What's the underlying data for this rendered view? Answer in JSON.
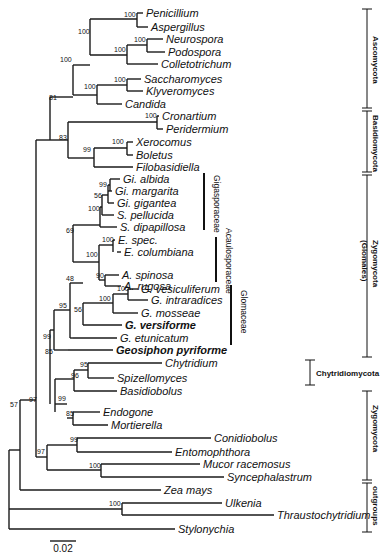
{
  "figure": {
    "type": "phylogenetic_tree",
    "scale_bar": {
      "label": "0.02",
      "x1": 50,
      "x2": 76,
      "y": 541
    }
  },
  "taxa": [
    {
      "name": "Penicillium",
      "x": 146,
      "y": 13,
      "tip_from": 137
    },
    {
      "name": "Aspergillus",
      "x": 151,
      "y": 27,
      "tip_from": 137
    },
    {
      "name": "Neurospora",
      "x": 166,
      "y": 39,
      "tip_from": 147
    },
    {
      "name": "Podospora",
      "x": 168,
      "y": 52,
      "tip_from": 147
    },
    {
      "name": "Colletotrichum",
      "x": 161,
      "y": 64,
      "tip_from": 127
    },
    {
      "name": "Saccharomyces",
      "x": 144,
      "y": 79,
      "tip_from": 127
    },
    {
      "name": "Klyveromyces",
      "x": 146,
      "y": 91,
      "tip_from": 127
    },
    {
      "name": "Candida",
      "x": 125,
      "y": 104,
      "tip_from": 97
    },
    {
      "name": "Cronartium",
      "x": 162,
      "y": 116,
      "tip_from": 157
    },
    {
      "name": "Peridermium",
      "x": 166,
      "y": 129,
      "tip_from": 157
    },
    {
      "name": "Xerocomus",
      "x": 136,
      "y": 142,
      "tip_from": 127
    },
    {
      "name": "Boletus",
      "x": 136,
      "y": 155,
      "tip_from": 127
    },
    {
      "name": "Filobasidiella",
      "x": 136,
      "y": 167,
      "tip_from": 94
    },
    {
      "name": "Gi. albida",
      "x": 123,
      "y": 179,
      "tip_from": 110
    },
    {
      "name": "Gi. margarita",
      "x": 115,
      "y": 191,
      "tip_from": 108
    },
    {
      "name": "Gi. gigantea",
      "x": 117,
      "y": 203,
      "tip_from": 108
    },
    {
      "name": "S. pellucida",
      "x": 117,
      "y": 215,
      "tip_from": 102
    },
    {
      "name": "S. dipapillosa",
      "x": 120,
      "y": 227,
      "tip_from": 100
    },
    {
      "name": "E. spec.",
      "x": 118,
      "y": 240,
      "tip_from": 113
    },
    {
      "name": "E. columbiana",
      "x": 124,
      "y": 252,
      "tip_from": 117
    },
    {
      "name": "A. spinosa",
      "x": 122,
      "y": 275,
      "tip_from": 105
    },
    {
      "name": "A. rugosa",
      "x": 124,
      "y": 286,
      "tip_from": 105
    },
    {
      "name": "G. vesiculiferum",
      "x": 141,
      "y": 289,
      "tip_from": 128
    },
    {
      "name": "G. intraradices",
      "x": 151,
      "y": 300,
      "tip_from": 128
    },
    {
      "name": "G. mosseae",
      "x": 141,
      "y": 313,
      "tip_from": 113
    },
    {
      "name": "G. versiforme",
      "x": 125,
      "y": 325,
      "tip_from": 83,
      "bold": true
    },
    {
      "name": "G. etunicatum",
      "x": 120,
      "y": 338,
      "tip_from": 73
    },
    {
      "name": "Geosiphon pyriforme",
      "x": 116,
      "y": 350,
      "tip_from": 68,
      "bold": true
    },
    {
      "name": "Chytridium",
      "x": 165,
      "y": 363,
      "tip_from": 88
    },
    {
      "name": "Spizellomyces",
      "x": 117,
      "y": 378,
      "tip_from": 88
    },
    {
      "name": "Basidiobolus",
      "x": 120,
      "y": 391,
      "tip_from": 74
    },
    {
      "name": "Endogone",
      "x": 103,
      "y": 412,
      "tip_from": 73
    },
    {
      "name": "Mortierella",
      "x": 111,
      "y": 425,
      "tip_from": 73
    },
    {
      "name": "Conidiobolus",
      "x": 214,
      "y": 438,
      "tip_from": 77
    },
    {
      "name": "Entomophthora",
      "x": 175,
      "y": 452,
      "tip_from": 77
    },
    {
      "name": "Mucor racemosus",
      "x": 203,
      "y": 464,
      "tip_from": 101
    },
    {
      "name": "Syncephalastrum",
      "x": 227,
      "y": 477,
      "tip_from": 101
    },
    {
      "name": "Zea mays",
      "x": 164,
      "y": 490,
      "tip_from": 20
    },
    {
      "name": "Ulkenia",
      "x": 225,
      "y": 503,
      "tip_from": 122
    },
    {
      "name": "Thraustochytridium",
      "x": 277,
      "y": 515,
      "tip_from": 122
    },
    {
      "name": "Stylonychia",
      "x": 178,
      "y": 529,
      "tip_from": 9
    }
  ],
  "branches": [
    "M137,13 V27",
    "M90,19 H137",
    "M147,39 V52",
    "M127,45 H147",
    "M127,45 V64",
    "M90,19 V55",
    "M90,55 H127",
    "M127,79 V91",
    "M97,85 H127",
    "M97,85 V104",
    "M73,65 V95",
    "M73,65 H90",
    "M73,95 H97",
    "M157,116 V129",
    "M68,122 H157",
    "M127,142 V155",
    "M94,148 H127",
    "M94,148 V167",
    "M68,122 V158",
    "M68,158 H94",
    "M50,97 V140",
    "M50,97 H73",
    "M50,140 H68",
    "M110,179 V191",
    "M108,185 H110",
    "M108,185 V203",
    "M102,195 V215",
    "M102,195 H108",
    "M100,207 V227",
    "M100,207 H102",
    "M113,240 V252",
    "M99,245 H113",
    "M105,275 V286",
    "M99,280 H105",
    "M99,245 V280",
    "M73,225 V262",
    "M73,225 H100",
    "M73,262 H99",
    "M128,289 V300",
    "M113,294 H128",
    "M113,294 V313",
    "M83,303 V325",
    "M83,303 H113",
    "M70,283 V338",
    "M70,283 H83",
    "M70,338 H73",
    "M54,310 V350",
    "M54,310 H70",
    "M54,350 H68",
    "M88,363 V378",
    "M74,370 H88",
    "M74,370 V391",
    "M55,379 V412",
    "M55,379 H74",
    "M73,412 V425",
    "M67,418 H73",
    "M55,404 H67",
    "M50,330 V404",
    "M50,330 H54",
    "M36,140 V330",
    "M36,140 H50",
    "M77,438 V452",
    "M47,445 H77",
    "M101,464 V477",
    "M47,470 H101",
    "M47,445 V470",
    "M36,457 H47",
    "M36,330 V457",
    "M20,400 V490",
    "M20,400 H36",
    "M122,503 V515",
    "M9,509 H122",
    "M9,509 V529",
    "M9,450 V509",
    "M9,450 H20"
  ],
  "bootstrap": [
    {
      "v": "100",
      "x": 124,
      "y": 17
    },
    {
      "v": "100",
      "x": 78,
      "y": 34
    },
    {
      "v": "100",
      "x": 134,
      "y": 42
    },
    {
      "v": "100",
      "x": 114,
      "y": 52
    },
    {
      "v": "100",
      "x": 60,
      "y": 62
    },
    {
      "v": "100",
      "x": 114,
      "y": 82
    },
    {
      "v": "100",
      "x": 84,
      "y": 89
    },
    {
      "v": "81",
      "x": 49,
      "y": 100
    },
    {
      "v": "100",
      "x": 145,
      "y": 118
    },
    {
      "v": "83",
      "x": 59,
      "y": 140
    },
    {
      "v": "100",
      "x": 112,
      "y": 144
    },
    {
      "v": "99",
      "x": 83,
      "y": 152
    },
    {
      "v": "99",
      "x": 99,
      "y": 187
    },
    {
      "v": "56",
      "x": 94,
      "y": 198
    },
    {
      "v": "100",
      "x": 88,
      "y": 211
    },
    {
      "v": "69",
      "x": 66,
      "y": 233
    },
    {
      "v": "100",
      "x": 102,
      "y": 242
    },
    {
      "v": "100",
      "x": 86,
      "y": 257
    },
    {
      "v": "90",
      "x": 96,
      "y": 278
    },
    {
      "v": "48",
      "x": 66,
      "y": 281
    },
    {
      "v": "100",
      "x": 117,
      "y": 291
    },
    {
      "v": "100",
      "x": 99,
      "y": 301
    },
    {
      "v": "95",
      "x": 59,
      "y": 308
    },
    {
      "v": "56",
      "x": 74,
      "y": 312
    },
    {
      "v": "99",
      "x": 43,
      "y": 339
    },
    {
      "v": "85",
      "x": 45,
      "y": 354
    },
    {
      "v": "95",
      "x": 80,
      "y": 367
    },
    {
      "v": "96",
      "x": 71,
      "y": 378
    },
    {
      "v": "99",
      "x": 58,
      "y": 401
    },
    {
      "v": "85",
      "x": 66,
      "y": 416
    },
    {
      "v": "97",
      "x": 29,
      "y": 402
    },
    {
      "v": "99",
      "x": 70,
      "y": 442
    },
    {
      "v": "97",
      "x": 37,
      "y": 454
    },
    {
      "v": "100",
      "x": 89,
      "y": 468
    },
    {
      "v": "57",
      "x": 10,
      "y": 407
    },
    {
      "v": "100",
      "x": 109,
      "y": 506
    }
  ],
  "families": [
    {
      "name": "Gigasporaceae",
      "bar_x": 204,
      "y1": 173,
      "y2": 230,
      "label_x": 214,
      "label_y": 175
    },
    {
      "name": "Acaulosporaceae",
      "bar_x": 216,
      "y1": 237,
      "y2": 282,
      "label_x": 226,
      "label_y": 228
    },
    {
      "name": "Glomaceae",
      "bar_x": 231,
      "y1": 285,
      "y2": 345,
      "label_x": 241,
      "label_y": 290
    }
  ],
  "groups": [
    {
      "name": "Ascomycota",
      "bar_x": 367,
      "y1": 9,
      "y2": 108,
      "label_x": 373,
      "label_y": 36,
      "orient": "vertical"
    },
    {
      "name": "Basidiomycota",
      "bar_x": 367,
      "y1": 111,
      "y2": 172,
      "label_x": 373,
      "label_y": 115,
      "orient": "vertical"
    },
    {
      "name": "Zygomycota",
      "bar_x": 367,
      "y1": 175,
      "y2": 357,
      "label_x": 373,
      "label_y": 240,
      "orient": "vertical"
    },
    {
      "name": "(Glomales)",
      "bar_x": null,
      "label_x": 362,
      "label_y": 240,
      "orient": "vertical"
    },
    {
      "name": "Chytridiomycota",
      "bar_x": 310,
      "y1": 360,
      "y2": 385,
      "label_x": 316,
      "label_y": 376,
      "orient": "horizontal"
    },
    {
      "name": "Zygomycota",
      "bar_x": 367,
      "y1": 391,
      "y2": 480,
      "label_x": 373,
      "label_y": 405,
      "orient": "vertical"
    },
    {
      "name": "outgroups",
      "bar_x": 367,
      "y1": 483,
      "y2": 532,
      "label_x": 373,
      "label_y": 486,
      "orient": "vertical"
    }
  ]
}
